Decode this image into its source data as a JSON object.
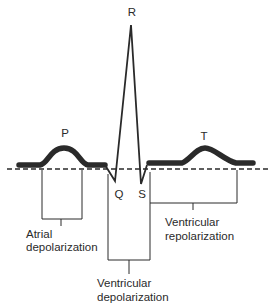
{
  "diagram": {
    "type": "ECG waveform",
    "colors": {
      "ink": "#2a2a2a",
      "background": "#ffffff"
    },
    "waves": {
      "p": "P",
      "q": "Q",
      "r": "R",
      "s": "S",
      "t": "T"
    },
    "annotations": {
      "atrial": {
        "line1": "Atrial",
        "line2": "depolarization"
      },
      "ventricular_depol": {
        "line1": "Ventricular",
        "line2": "depolarization"
      },
      "ventricular_repol": {
        "line1": "Ventricular",
        "line2": "repolarization"
      }
    },
    "baseline": "isoelectric line (dashed)"
  }
}
